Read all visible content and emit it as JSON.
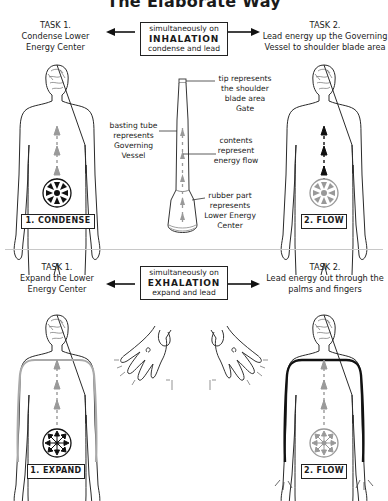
{
  "title": "The Elaborate Way",
  "inhalation": {
    "task1": {
      "heading": "TASK 1.",
      "lines": [
        "Condense Lower",
        "Energy Center"
      ]
    },
    "center": {
      "line1": "simultaneously on",
      "line2": "INHALATION",
      "line3": "condense and lead"
    },
    "task2": {
      "heading": "TASK 2.",
      "lines": [
        "Lead energy up the Governing",
        "Vessel to shoulder blade area"
      ]
    },
    "step1_label": "1. CONDENSE",
    "step2_label": "2. FLOW",
    "tube_labels": {
      "tip": [
        "tip represents",
        "the shoulder",
        "blade area",
        "Gate"
      ],
      "tube": [
        "basting tube",
        "represents",
        "Governing",
        "Vessel"
      ],
      "contents": [
        "contents",
        "represent",
        "energy flow"
      ],
      "rubber": [
        "rubber part",
        "represents",
        "Lower Energy",
        "Center"
      ]
    }
  },
  "exhalation": {
    "task1": {
      "heading": "TASK 1.",
      "lines": [
        "Expand the Lower",
        "Energy Center"
      ]
    },
    "center": {
      "line1": "simultaneously on",
      "line2": "EXHALATION",
      "line3": "expand and lead"
    },
    "task2": {
      "heading": "TASK 2.",
      "lines": [
        "Lead energy out through the",
        "palms and fingers"
      ]
    },
    "step1_label": "1. EXPAND",
    "step2_label": "2. FLOW"
  },
  "icons": {
    "wheel_condense": "condense-wheel-icon",
    "wheel_expand": "expand-wheel-icon",
    "arrow": "double-arrow-icon"
  },
  "colors": {
    "ink": "#1a1a1a",
    "gray_flow": "#9a9a9a",
    "divider": "#c8c8c8"
  }
}
